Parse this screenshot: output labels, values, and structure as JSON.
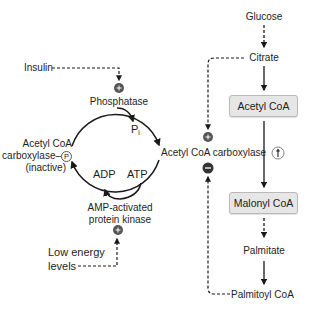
{
  "left_cycle": {
    "insulin": "Insulin",
    "phosphatase": "Phosphatase",
    "pi_main": "P",
    "pi_sub": "i",
    "inactive_line1": "Acetyl CoA",
    "inactive_line2": "carboxylase–",
    "inactive_p": "P",
    "inactive_line3": "(inactive)",
    "active_label": "Acetyl CoA carboxylase",
    "adp": "ADP",
    "atp": "ATP",
    "ampk_line1": "AMP-activated",
    "ampk_line2": "protein kinase",
    "low_energy_line1": "Low energy",
    "low_energy_line2": "levels"
  },
  "right_pathway": {
    "glucose": "Glucose",
    "citrate": "Citrate",
    "acetyl_coa": "Acetyl CoA",
    "malonyl_coa": "Malonyl CoA",
    "palmitate": "Palmitate",
    "palmitoyl_coa": "Palmitoyl CoA"
  },
  "regulation_icons": {
    "plus": "+",
    "minus": "−",
    "up": "↑"
  },
  "colors": {
    "line": "#1a1a1a",
    "regulator_circle": "#555555",
    "box_fill": "#e6e6e6",
    "box_border": "#b9b9b9"
  }
}
